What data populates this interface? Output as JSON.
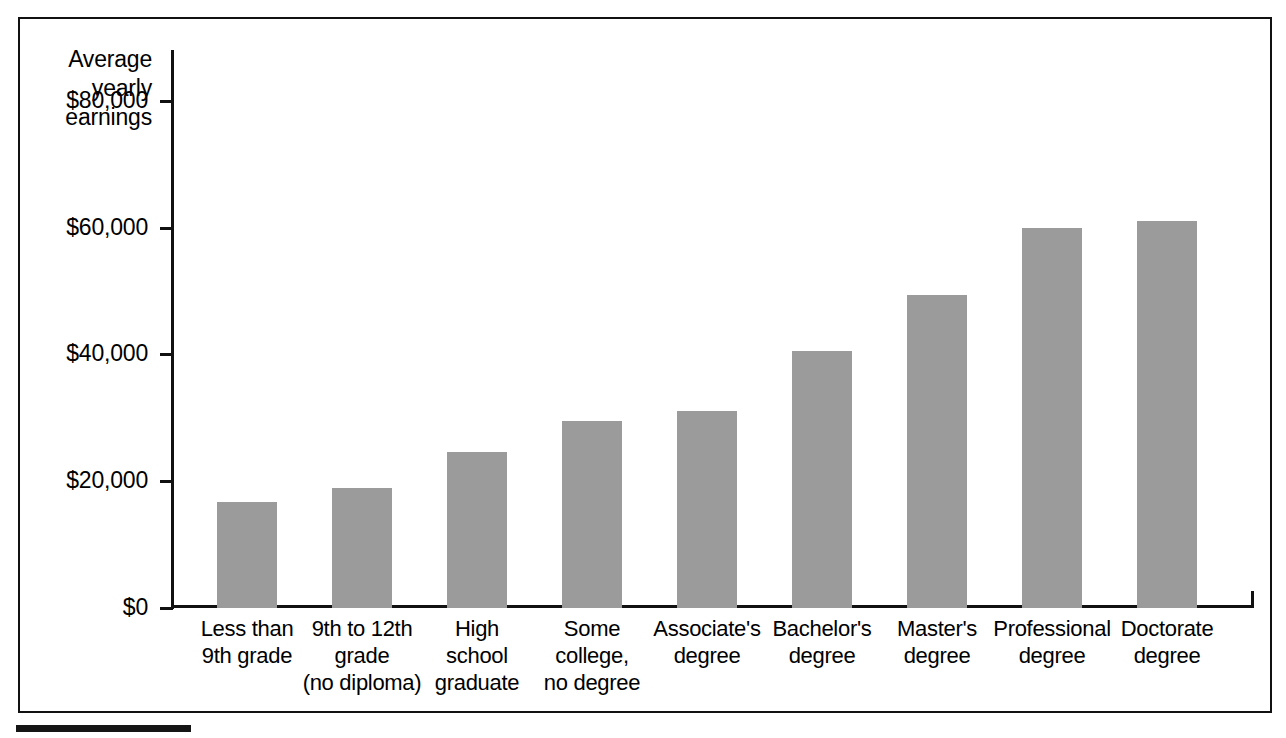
{
  "chart_data": {
    "type": "bar",
    "title": "",
    "ylabel_lines": [
      "Average",
      "yearly",
      "earnings"
    ],
    "xlabel": "",
    "ylim": [
      0,
      88000
    ],
    "ytick_values": [
      80000,
      60000,
      40000,
      20000,
      0
    ],
    "ytick_labels": [
      "$80,000",
      "$60,000",
      "$40,000",
      "$20,000",
      "$0"
    ],
    "grid": false,
    "legend": false,
    "bar_color": "#9b9b9b",
    "axis_color": "#111111",
    "categories": [
      "Less than\n9th grade",
      "9th to 12th\ngrade\n(no diploma)",
      "High\nschool\ngraduate",
      "Some\ncollege,\nno degree",
      "Associate's\ndegree",
      "Bachelor's\ndegree",
      "Master's\ndegree",
      "Professional\ndegree",
      "Doctorate\ndegree"
    ],
    "category_lines": [
      [
        "Less than",
        "9th grade"
      ],
      [
        "9th to 12th",
        "grade",
        "(no diploma)"
      ],
      [
        "High",
        "school",
        "graduate"
      ],
      [
        "Some",
        "college,",
        "no degree"
      ],
      [
        "Associate's",
        "degree"
      ],
      [
        "Bachelor's",
        "degree"
      ],
      [
        "Master's",
        "degree"
      ],
      [
        "Professional",
        "degree"
      ],
      [
        "Doctorate",
        "degree"
      ]
    ],
    "values": [
      16700,
      18900,
      24600,
      29500,
      31000,
      40500,
      49400,
      60000,
      61100
    ]
  }
}
